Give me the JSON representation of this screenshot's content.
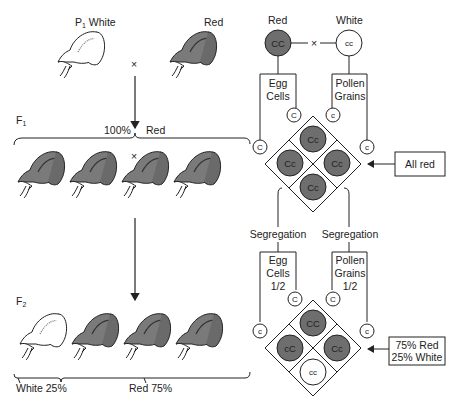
{
  "left_panel": {
    "p1_label": "P",
    "p1_sub": "1",
    "p1_white": "White",
    "p1_red": "Red",
    "cross_symbol": "×",
    "f1_label": "F",
    "f1_sub": "1",
    "f1_percent": "100%",
    "f1_red": "Red",
    "f2_label": "F",
    "f2_sub": "2",
    "f2_white": "White 25%",
    "f2_red": "Red 75%"
  },
  "right_panel": {
    "parent_red_label": "Red",
    "parent_white_label": "White",
    "parent_red_genotype": "CC",
    "parent_white_genotype": "cc",
    "cross_symbol": "×",
    "egg_cells_1": "Egg",
    "egg_cells_2": "Cells",
    "pollen_grains_1": "Pollen",
    "pollen_grains_2": "Grains",
    "gamete_egg_top": "C",
    "gamete_egg_left": "C",
    "gamete_pollen_top": "c",
    "gamete_pollen_right": "c",
    "f1_grid": [
      "Cc",
      "Cc",
      "Cc",
      "Cc"
    ],
    "f1_result": "All red",
    "segregation_left": "Segregation",
    "segregation_right": "Segregation",
    "egg_fraction": "1/2",
    "pollen_fraction": "1/2",
    "f2_gamete_egg_top": "C",
    "f2_gamete_egg_left": "c",
    "f2_gamete_pollen_top": "C",
    "f2_gamete_pollen_right": "c",
    "f2_grid": [
      "CC",
      "cC",
      "Cc",
      "cc"
    ],
    "f2_result_1": "75% Red",
    "f2_result_2": "25% White"
  },
  "colors": {
    "red_fill": "#6e6e6e",
    "white_fill": "#ffffff",
    "line": "#222222"
  }
}
